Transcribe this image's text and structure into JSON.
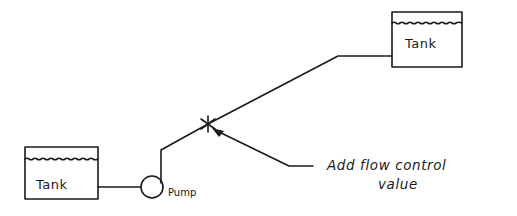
{
  "diagram": {
    "type": "process-flow-sketch",
    "nodes": [
      {
        "id": "tank-source",
        "label": "Tank",
        "kind": "tank"
      },
      {
        "id": "pump",
        "label": "Pump",
        "kind": "pump"
      },
      {
        "id": "valve",
        "label": "",
        "kind": "flow-control-valve"
      },
      {
        "id": "tank-destination",
        "label": "Tank",
        "kind": "tank"
      }
    ],
    "edges": [
      {
        "from": "tank-source",
        "to": "pump"
      },
      {
        "from": "pump",
        "to": "valve"
      },
      {
        "from": "valve",
        "to": "tank-destination"
      }
    ],
    "annotation": {
      "line1": "Add flow control",
      "line2": "value",
      "points_to": "valve"
    }
  },
  "colors": {
    "ink": "#1a1a1a",
    "paper": "#ffffff"
  }
}
